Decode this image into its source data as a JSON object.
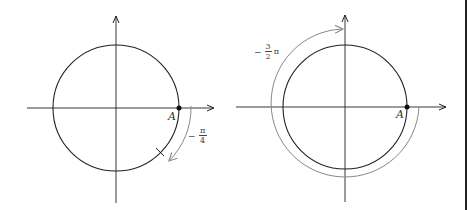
{
  "figures": [
    {
      "id": "left",
      "point_label": "A",
      "angle_label": {
        "sign": "−",
        "numerator": "π",
        "denominator": "4",
        "suffix": ""
      },
      "angle_radians": "-pi/4"
    },
    {
      "id": "right",
      "point_label": "A",
      "angle_label": {
        "sign": "−",
        "numerator": "3",
        "denominator": "2",
        "suffix": "π"
      },
      "angle_radians": "-3pi/2"
    }
  ],
  "colors": {
    "axis": "#222222",
    "circle": "#222222",
    "arc": "#888888"
  }
}
